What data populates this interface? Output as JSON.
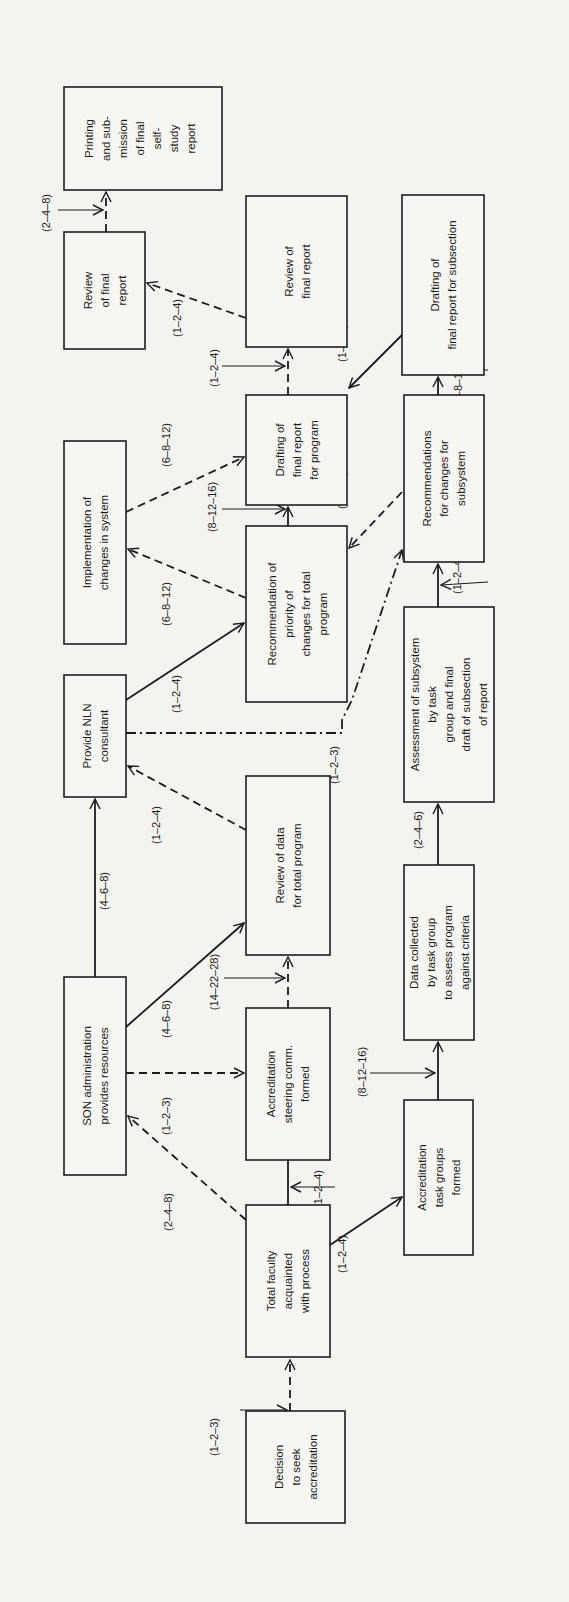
{
  "diagram": {
    "orientation": "rotated 90° counter-clockwise (text reads bottom-to-top)",
    "nodes": [
      {
        "id": "decision",
        "lines": [
          "Decision",
          "to seek",
          "accreditation"
        ]
      },
      {
        "id": "total_faculty",
        "lines": [
          "Total faculty",
          "acquainted",
          "with process"
        ]
      },
      {
        "id": "son_admin",
        "lines": [
          "SON administration",
          "provides resources"
        ]
      },
      {
        "id": "steering",
        "lines": [
          "Accreditation",
          "steering comm.",
          "formed"
        ]
      },
      {
        "id": "task_groups",
        "lines": [
          "Accreditation",
          "task groups",
          "formed"
        ]
      },
      {
        "id": "data_collected",
        "lines": [
          "Data collected",
          "by task group",
          "to assess program",
          "against criteria"
        ]
      },
      {
        "id": "review_data",
        "lines": [
          "Review of data",
          "for total program"
        ]
      },
      {
        "id": "nln",
        "lines": [
          "Provide NLN",
          "consultant"
        ]
      },
      {
        "id": "assessment",
        "lines": [
          "Assessment of subsystem",
          "by task",
          "group and final",
          "draft of subsection",
          "of report"
        ]
      },
      {
        "id": "rec_priority",
        "lines": [
          "Recommendation of",
          "priority of",
          "changes for total",
          "program"
        ]
      },
      {
        "id": "implementation",
        "lines": [
          "Implementation of",
          "changes in system"
        ]
      },
      {
        "id": "rec_subsystem",
        "lines": [
          "Recommendations",
          "for changes for",
          "subsystem"
        ]
      },
      {
        "id": "drafting_program",
        "lines": [
          "Drafting of",
          "final report",
          "for program"
        ]
      },
      {
        "id": "drafting_subsection",
        "lines": [
          "Drafting of",
          "final report for subsection"
        ]
      },
      {
        "id": "review_final_large",
        "lines": [
          "Review of",
          "final report"
        ]
      },
      {
        "id": "review_final_small",
        "lines": [
          "Review",
          "of final",
          "report"
        ]
      },
      {
        "id": "printing",
        "lines": [
          "Printing",
          "and sub-",
          "mission",
          "of final",
          "self-",
          "study",
          "report"
        ]
      }
    ],
    "edges": [
      {
        "from": "decision",
        "to": "total_faculty",
        "style": "dashed",
        "time": "(1–2–3)"
      },
      {
        "from": "total_faculty",
        "to": "son_admin",
        "style": "dashed",
        "time": "(2–4–8)"
      },
      {
        "from": "total_faculty",
        "to": "steering",
        "style": "solid",
        "time": "(1–2–4)"
      },
      {
        "from": "total_faculty",
        "to": "task_groups",
        "style": "solid",
        "time": "(1–2–4)"
      },
      {
        "from": "son_admin",
        "to": "steering",
        "style": "dashed",
        "time": "(1–2–3)"
      },
      {
        "from": "son_admin",
        "to": "review_data",
        "style": "solid",
        "time": "(4–6–8)"
      },
      {
        "from": "son_admin",
        "to": "nln",
        "style": "solid",
        "time": "(4–6–8)"
      },
      {
        "from": "steering",
        "to": "review_data",
        "style": "dashed",
        "time": "(14–22–28)"
      },
      {
        "from": "task_groups",
        "to": "data_collected",
        "style": "solid",
        "time": "(8–12–16)"
      },
      {
        "from": "data_collected",
        "to": "assessment",
        "style": "solid",
        "time": "(2–4–6)"
      },
      {
        "from": "review_data",
        "to": "nln",
        "style": "dashed",
        "time": "(1–2–4)"
      },
      {
        "from": "nln",
        "to": "rec_subsystem",
        "style": "dash-dot",
        "time": "(1–2–3)"
      },
      {
        "from": "nln",
        "to": "rec_priority",
        "style": "solid",
        "time": "(1–2–4)"
      },
      {
        "from": "assessment",
        "to": "rec_subsystem",
        "style": "solid",
        "time": "(1–2–4)"
      },
      {
        "from": "rec_priority",
        "to": "implementation",
        "style": "dashed",
        "time": "(6–8–12)"
      },
      {
        "from": "rec_priority",
        "to": "drafting_program",
        "style": "solid",
        "time": "(8–12–16)"
      },
      {
        "from": "implementation",
        "to": "drafting_program",
        "style": "dashed",
        "time": "(6–8–12)"
      },
      {
        "from": "rec_subsystem",
        "to": "rec_priority",
        "style": "dashed",
        "time": "(1–2–3)"
      },
      {
        "from": "rec_subsystem",
        "to": "drafting_subsection",
        "style": "solid",
        "time": "(4–8–12)"
      },
      {
        "from": "drafting_subsection",
        "to": "drafting_program",
        "style": "solid",
        "time": "(1–2–3)"
      },
      {
        "from": "drafting_program",
        "to": "review_final_large",
        "style": "dashed",
        "time": "(1–2–4)"
      },
      {
        "from": "review_final_large",
        "to": "review_final_small",
        "style": "dashed",
        "time": "(1–2–4)"
      },
      {
        "from": "review_final_small",
        "to": "printing",
        "style": "dashed",
        "time": "(2–4–8)"
      }
    ]
  },
  "labels": {
    "decision_total": "(1–2–3)",
    "total_son": "(2–4–8)",
    "total_steering": "(1–2–4)",
    "total_taskgroups": "(1–2–4)",
    "son_steering": "(1–2–3)",
    "son_reviewdata": "(4–6–8)",
    "son_nln": "(4–6–8)",
    "steering_reviewdata": "(14–22–28)",
    "taskgroups_data": "(8–12–16)",
    "data_assessment": "(2–4–6)",
    "reviewdata_nln": "(1–2–4)",
    "nln_recsub": "(1–2–3)",
    "nln_recpriority": "(1–2–4)",
    "assessment_recsub": "(1–2–4)",
    "recpriority_impl": "(6–8–12)",
    "recpriority_drafting": "(8–12–16)",
    "impl_drafting": "(6–8–12)",
    "recsub_recpriority": "(1–2–3)",
    "recsub_draftsub": "(4–8–12)",
    "draftsub_draftprog": "(1–2–3)",
    "draftprog_review": "(1–2–4)",
    "review_review": "(1–2–4)",
    "review_printing": "(2–4–8)"
  }
}
